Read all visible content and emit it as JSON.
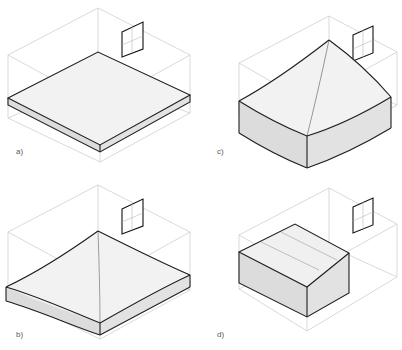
{
  "figure": {
    "type": "technical-illustration",
    "panel_count": 4,
    "background_color": "#ffffff",
    "caption_partial": ""
  },
  "style": {
    "wireframe_line_color": "#c9c9c9",
    "wireframe_line_width": 0.7,
    "slab_outline_color": "#1e1e1e",
    "slab_outline_width": 1.1,
    "slab_top_fill": "#f2f2f2",
    "slab_side_fill": "#e2e2e2",
    "slab_front_fill": "#dcdcdc",
    "window_outline_color": "#111111",
    "window_fill": "#ffffff",
    "window_mullion_color": "#b0b0b0",
    "label_color": "#5a5a5a",
    "label_font_size": 8
  },
  "panels": [
    {
      "id": "a",
      "label": "a)",
      "position": "top-left",
      "surface_type": "flat-horizontal-slab",
      "surface_description": "Flat horizontal slab resting low in the room, uniform thickness, level on all sides",
      "slab_level": "low",
      "has_window": true
    },
    {
      "id": "c",
      "label": "c)",
      "position": "top-right",
      "surface_type": "curved-saddle-surface",
      "surface_description": "Upward curving saddle / hyperbolic surface rising toward the back-right corner",
      "slab_level": "low-curved",
      "has_window": true
    },
    {
      "id": "b",
      "label": "b)",
      "position": "bottom-left",
      "surface_type": "warped-sloping-slab",
      "surface_description": "Gently warped slab sloping downward from the back edge toward the front",
      "slab_level": "mid-low",
      "has_window": true
    },
    {
      "id": "d",
      "label": "d)",
      "position": "bottom-right",
      "surface_type": "elevated-tilted-slab",
      "surface_description": "Thick slab raised above the floor and tilted, occupying the upper-left half of the room volume",
      "slab_level": "elevated",
      "has_window": true
    }
  ],
  "window_detail": {
    "name": "wall-window",
    "shape": "parallelogram",
    "location": "back-right wall, upper area",
    "mullions": "crosshair"
  }
}
